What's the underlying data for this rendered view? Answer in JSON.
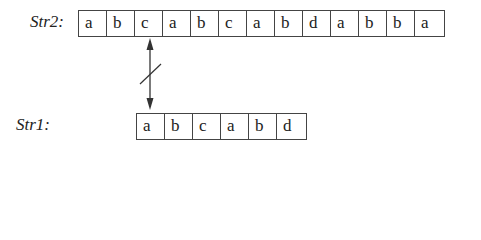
{
  "str2": {
    "label": "Str2:",
    "cells": [
      "a",
      "b",
      "c",
      "a",
      "b",
      "c",
      "a",
      "b",
      "d",
      "a",
      "b",
      "b",
      "a"
    ]
  },
  "str1": {
    "label": "Str1:",
    "cells": [
      "a",
      "b",
      "c",
      "a",
      "b",
      "d"
    ]
  },
  "connector": {
    "type": "double-arrow-with-slash",
    "meaning": "mismatch",
    "from_str2_index": 2,
    "to_str1_index": 0
  }
}
